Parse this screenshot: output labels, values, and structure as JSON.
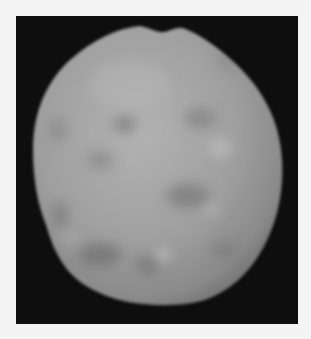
{
  "image": {
    "subject": "lumpy grey rocky body",
    "description": "Grayscale rendering of an irregular, roughly spherical lumpy object with a notch at the top, centered on a black background with a white margin",
    "colors": {
      "margin": "#f4f4f4",
      "background": "#0e0e0e",
      "object_light": "#b4b4b4",
      "object_mid": "#9a9a9a",
      "object_dark": "#6e6e6e"
    }
  }
}
